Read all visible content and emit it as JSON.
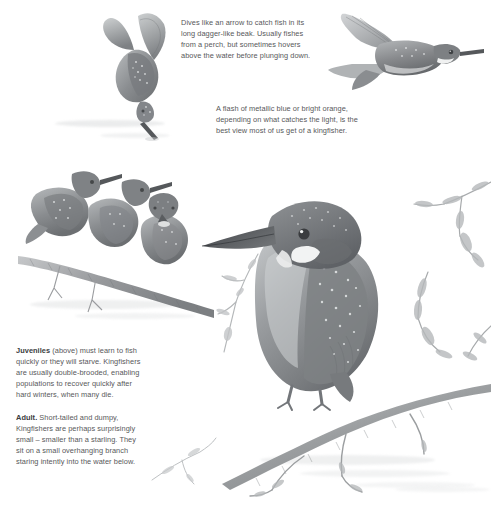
{
  "plate": {
    "title": "Kingfisher",
    "medium": "grayscale natural history illustration",
    "background_color": "#ffffff",
    "text_color": "#57585a",
    "artwork_color": "#8d9092"
  },
  "captions": {
    "dive": {
      "text": "Dives like an arrow to catch fish in its long dagger-like beak. Usually fishes from a perch, but sometimes hovers above the water before plunging down."
    },
    "flash": {
      "text": "A flash of metallic blue or bright orange, depending on what catches the light, is the best view most of us get of a kingfisher."
    },
    "juveniles": {
      "lead": "Juveniles",
      "text": " (above) must learn to fish quickly or they will starve. Kingfishers are usually double-brooded, enabling populations to recover quickly after hard winters, when many die."
    },
    "adult": {
      "lead": "Adult.",
      "text": " Short-tailed and dumpy, Kingfishers are perhaps surprisingly small – smaller than a starling. They sit on a small overhanging branch staring intently into the water below."
    }
  },
  "figures": {
    "diving_bird": "kingfisher-diving-icon",
    "flying_bird": "kingfisher-flying-icon",
    "juvenile_group": "kingfisher-juveniles-icon",
    "adult_bird": "kingfisher-adult-icon",
    "perch_branch": "branch-icon",
    "leafy_twigs": "leafy-twig-icon",
    "water_surface": "water-ripple-icon"
  }
}
